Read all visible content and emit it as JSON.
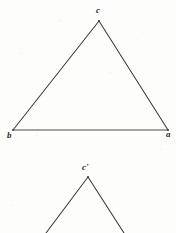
{
  "figure": {
    "background_color": "#fdfdfc",
    "ink_color": "#3a3a3a",
    "label_color": "#2b2b2b",
    "canvas": {
      "width": 176,
      "height": 233
    }
  },
  "figure_one": {
    "name": "triangle-abc",
    "description": "Closed triangle with apex at top and horizontal base",
    "vertices": [
      {
        "id": "c",
        "label": "c",
        "x": 99,
        "y": 21,
        "label_x": 100,
        "label_y": 12
      },
      {
        "id": "b",
        "label": "b",
        "x": 13,
        "y": 130,
        "label_x": 11,
        "label_y": 137
      },
      {
        "id": "a",
        "label": "a",
        "x": 168,
        "y": 130,
        "label_x": 170,
        "label_y": 136
      }
    ],
    "edges": [
      {
        "id": "cb",
        "from": "c",
        "to": "b"
      },
      {
        "id": "ca",
        "from": "c",
        "to": "a"
      },
      {
        "id": "ba",
        "from": "b",
        "to": "a"
      }
    ]
  },
  "figure_two": {
    "name": "angle-c-prime",
    "description": "Open angle / partial triangle, apex at top, two legs running off the bottom edge",
    "vertices": [
      {
        "id": "c-prime",
        "label": "c'",
        "x": 88,
        "y": 177,
        "label_x": 87,
        "label_y": 169
      }
    ],
    "edges": [
      {
        "id": "left-leg",
        "from_x": 88,
        "from_y": 177,
        "to_x": 46,
        "to_y": 233
      },
      {
        "id": "right-leg",
        "from_x": 88,
        "from_y": 177,
        "to_x": 124,
        "to_y": 233
      }
    ]
  },
  "labels": {
    "c": "c",
    "b": "b",
    "a": "a",
    "c_prime": "c'"
  }
}
